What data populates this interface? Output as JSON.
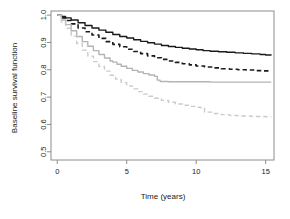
{
  "figure": {
    "title": "",
    "background_color": "#ffffff"
  },
  "chart_data": {
    "type": "line",
    "title": "",
    "subtitle": "",
    "xlabel": "Time (years)",
    "ylabel": "Baseline survival function",
    "xlim": [
      -0.45,
      15.6
    ],
    "ylim": [
      0.47,
      1.015
    ],
    "xticks": [
      0,
      5,
      10,
      15
    ],
    "xtick_labels": [
      "0",
      "5",
      "10",
      "15"
    ],
    "yticks": [
      0.5,
      0.6,
      0.7,
      0.8,
      0.9,
      1.0
    ],
    "ytick_labels": [
      "0.5",
      "0.6",
      "0.7",
      "0.8",
      "0.9",
      "1.0"
    ],
    "grid": false,
    "legend": "none",
    "box": true,
    "annotations": [],
    "series": [
      {
        "name": "curve-1-black-solid",
        "color": "#1a1a1a",
        "linestyle": "solid",
        "linewidth": 1.4,
        "x": [
          0.0,
          0.3,
          0.6,
          1.0,
          1.5,
          2.0,
          2.5,
          3.0,
          3.5,
          4.0,
          4.5,
          5.0,
          5.5,
          6.0,
          6.5,
          7.0,
          7.5,
          8.0,
          8.5,
          9.0,
          9.5,
          10.0,
          10.5,
          11.0,
          11.6,
          12.2,
          12.8,
          13.4,
          14.0,
          14.6,
          15.0,
          15.4
        ],
        "y": [
          1.0,
          0.995,
          0.99,
          0.982,
          0.972,
          0.962,
          0.953,
          0.945,
          0.937,
          0.929,
          0.922,
          0.916,
          0.91,
          0.904,
          0.899,
          0.894,
          0.889,
          0.885,
          0.882,
          0.879,
          0.876,
          0.873,
          0.87,
          0.868,
          0.866,
          0.864,
          0.862,
          0.86,
          0.858,
          0.856,
          0.854,
          0.853
        ]
      },
      {
        "name": "curve-2-black-dashed",
        "color": "#1a1a1a",
        "linestyle": "dashed",
        "linewidth": 1.6,
        "x": [
          0.0,
          0.3,
          0.6,
          1.0,
          1.5,
          2.0,
          2.5,
          3.0,
          3.5,
          4.0,
          4.5,
          5.0,
          5.5,
          6.0,
          6.5,
          7.0,
          7.5,
          8.0,
          8.5,
          9.0,
          9.5,
          10.0,
          10.6,
          11.2,
          11.8,
          12.4,
          13.0,
          13.6,
          14.2,
          14.8,
          15.4
        ],
        "y": [
          1.0,
          0.99,
          0.98,
          0.968,
          0.953,
          0.939,
          0.927,
          0.915,
          0.903,
          0.893,
          0.884,
          0.875,
          0.867,
          0.859,
          0.851,
          0.844,
          0.838,
          0.832,
          0.827,
          0.822,
          0.818,
          0.814,
          0.81,
          0.807,
          0.804,
          0.802,
          0.8,
          0.799,
          0.797,
          0.796,
          0.795
        ]
      },
      {
        "name": "curve-3-grey-solid",
        "color": "#b4b4b4",
        "linestyle": "solid",
        "linewidth": 1.4,
        "x": [
          0.0,
          0.3,
          0.6,
          1.0,
          1.4,
          1.8,
          2.2,
          2.6,
          3.0,
          3.4,
          3.8,
          4.0,
          4.3,
          4.6,
          5.0,
          5.4,
          5.8,
          6.2,
          6.6,
          7.0,
          7.2,
          7.4,
          8.0,
          9.0,
          10.0,
          11.0,
          12.0,
          13.0,
          14.0,
          15.0,
          15.4
        ],
        "y": [
          1.0,
          0.982,
          0.965,
          0.943,
          0.922,
          0.903,
          0.886,
          0.87,
          0.856,
          0.843,
          0.832,
          0.828,
          0.82,
          0.813,
          0.805,
          0.798,
          0.792,
          0.786,
          0.781,
          0.776,
          0.762,
          0.757,
          0.756,
          0.756,
          0.756,
          0.755,
          0.755,
          0.755,
          0.755,
          0.755,
          0.755
        ]
      },
      {
        "name": "curve-4-grey-dashed",
        "color": "#cbcbcb",
        "linestyle": "dashed",
        "linewidth": 1.4,
        "x": [
          0.0,
          0.3,
          0.6,
          1.0,
          1.4,
          1.8,
          2.2,
          2.6,
          3.0,
          3.4,
          3.8,
          4.2,
          4.6,
          5.0,
          5.4,
          5.8,
          6.2,
          6.6,
          7.0,
          7.5,
          8.0,
          8.5,
          9.0,
          9.5,
          10.0,
          10.3,
          10.6,
          11.2,
          11.8,
          12.4,
          13.0,
          14.0,
          15.0,
          15.4
        ],
        "y": [
          1.0,
          0.975,
          0.952,
          0.923,
          0.896,
          0.872,
          0.85,
          0.83,
          0.812,
          0.795,
          0.78,
          0.766,
          0.753,
          0.741,
          0.73,
          0.72,
          0.711,
          0.703,
          0.696,
          0.688,
          0.681,
          0.675,
          0.67,
          0.666,
          0.663,
          0.661,
          0.645,
          0.64,
          0.636,
          0.633,
          0.631,
          0.629,
          0.628,
          0.628
        ]
      }
    ]
  }
}
